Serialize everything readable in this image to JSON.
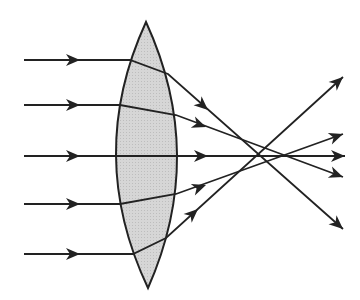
{
  "diagram": {
    "lens": {
      "type": "biconvex",
      "fill": "#d4d4d4",
      "stroke": "#222222",
      "top_apex": [
        146,
        22
      ],
      "bottom_apex": [
        148,
        288
      ],
      "left_mid_x": 116,
      "right_mid_x": 177
    },
    "ray_color": "#222222",
    "rays": [
      {
        "id": "ray-1",
        "incoming_y": 60,
        "path": [
          [
            24,
            60
          ],
          [
            130,
            60
          ],
          [
            168,
            74
          ],
          [
            343,
            229
          ]
        ],
        "in_arrow": [
          80,
          60
        ],
        "out_arrow": [
          208,
          110
        ],
        "tip": [
          343,
          229
        ]
      },
      {
        "id": "ray-2",
        "incoming_y": 105,
        "path": [
          [
            24,
            105
          ],
          [
            120,
            105
          ],
          [
            176,
            115
          ],
          [
            343,
            177
          ]
        ],
        "in_arrow": [
          80,
          105
        ],
        "out_arrow": [
          206,
          127
        ],
        "tip": [
          343,
          177
        ]
      },
      {
        "id": "ray-3",
        "incoming_y": 156,
        "path": [
          [
            24,
            156
          ],
          [
            345,
            156
          ]
        ],
        "in_arrow": [
          80,
          156
        ],
        "out_arrow": [
          208,
          156
        ],
        "tip": [
          345,
          156
        ]
      },
      {
        "id": "ray-4",
        "incoming_y": 204,
        "path": [
          [
            24,
            204
          ],
          [
            120,
            204
          ],
          [
            176,
            194
          ],
          [
            343,
            134
          ]
        ],
        "in_arrow": [
          80,
          204
        ],
        "out_arrow": [
          206,
          185
        ],
        "tip": [
          343,
          134
        ]
      },
      {
        "id": "ray-5",
        "incoming_y": 254,
        "path": [
          [
            24,
            254
          ],
          [
            133,
            254
          ],
          [
            166,
            238
          ],
          [
            343,
            77
          ]
        ],
        "in_arrow": [
          80,
          254
        ],
        "out_arrow": [
          198,
          209
        ],
        "tip": [
          343,
          77
        ]
      }
    ]
  }
}
